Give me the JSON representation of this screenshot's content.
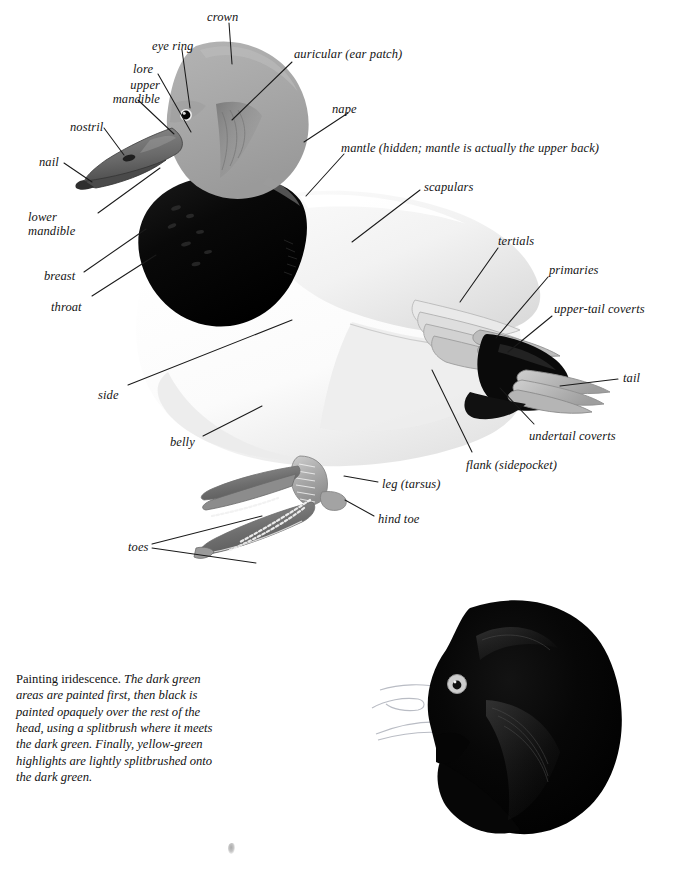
{
  "page": {
    "background_color": "#ffffff",
    "width": 673,
    "height": 870
  },
  "diagram": {
    "name": "duck-topography",
    "colors": {
      "head_gray": "#a8a8a8",
      "head_shadow": "#8d8d8d",
      "breast_black": "#0b0b0b",
      "body_white": "#fdfdfd",
      "body_shade": "#e2e2e2",
      "bill_gray": "#6f6f6f",
      "bill_dark": "#3a3a3a",
      "foot_gray": "#b8b8b8",
      "leader_line": "#1a1a1a",
      "text": "#141414"
    },
    "labels": [
      {
        "id": "crown",
        "text": "crown",
        "x": 207,
        "y": 10,
        "anchor": "start"
      },
      {
        "id": "eye-ring",
        "text": "eye ring",
        "x": 152,
        "y": 39,
        "anchor": "start"
      },
      {
        "id": "auricular",
        "text": "auricular (ear patch)",
        "x": 294,
        "y": 47,
        "anchor": "start"
      },
      {
        "id": "lore",
        "text": "lore",
        "x": 133,
        "y": 62,
        "anchor": "start"
      },
      {
        "id": "upper-mandible",
        "text": "upper\nmandible",
        "x": 86,
        "y": 78,
        "anchor": "start"
      },
      {
        "id": "nape",
        "text": "nape",
        "x": 332,
        "y": 102,
        "anchor": "start"
      },
      {
        "id": "nostril",
        "text": "nostril",
        "x": 70,
        "y": 120,
        "anchor": "start"
      },
      {
        "id": "mantle",
        "text": "mantle (hidden; mantle is actually the upper back)",
        "x": 341,
        "y": 141,
        "anchor": "start"
      },
      {
        "id": "nail",
        "text": "nail",
        "x": 39,
        "y": 155,
        "anchor": "start"
      },
      {
        "id": "scapulars",
        "text": "scapulars",
        "x": 424,
        "y": 180,
        "anchor": "start"
      },
      {
        "id": "lower-mandible",
        "text": "lower\nmandible",
        "x": 41,
        "y": 210,
        "anchor": "start"
      },
      {
        "id": "tertials",
        "text": "tertials",
        "x": 498,
        "y": 234,
        "anchor": "start"
      },
      {
        "id": "primaries",
        "text": "primaries",
        "x": 549,
        "y": 263,
        "anchor": "start"
      },
      {
        "id": "breast",
        "text": "breast",
        "x": 44,
        "y": 269,
        "anchor": "start"
      },
      {
        "id": "upper-tail-coverts",
        "text": "upper-tail coverts",
        "x": 554,
        "y": 302,
        "anchor": "start"
      },
      {
        "id": "throat",
        "text": "throat",
        "x": 51,
        "y": 300,
        "anchor": "start"
      },
      {
        "id": "tail",
        "text": "tail",
        "x": 623,
        "y": 371,
        "anchor": "start"
      },
      {
        "id": "side",
        "text": "side",
        "x": 98,
        "y": 388,
        "anchor": "start"
      },
      {
        "id": "undertail-coverts",
        "text": "undertail coverts",
        "x": 529,
        "y": 429,
        "anchor": "start"
      },
      {
        "id": "belly",
        "text": "belly",
        "x": 170,
        "y": 435,
        "anchor": "start"
      },
      {
        "id": "flank",
        "text": "flank (sidepocket)",
        "x": 466,
        "y": 458,
        "anchor": "start"
      },
      {
        "id": "leg-tarsus",
        "text": "leg (tarsus)",
        "x": 382,
        "y": 477,
        "anchor": "start"
      },
      {
        "id": "hind-toe",
        "text": "hind toe",
        "x": 378,
        "y": 512,
        "anchor": "start"
      },
      {
        "id": "toes",
        "text": "toes",
        "x": 128,
        "y": 540,
        "anchor": "start"
      }
    ]
  },
  "caption": {
    "name": "painting-iridescence-caption",
    "lead": "Painting iridescence.",
    "body": " The dark green areas are painted first, then black is painted opaquely over the rest of the head, using a splitbrush where it meets the dark green. Finally, yellow-green highlights are lightly splitbrushed onto the dark green."
  },
  "head_study": {
    "name": "iridescent-head-study",
    "description": "black duck head with pale outlined bill and pale eye ring",
    "eye_color": "#c9c9c9",
    "head_color": "#050505",
    "bill_outline_color": "#b9bcc4"
  }
}
